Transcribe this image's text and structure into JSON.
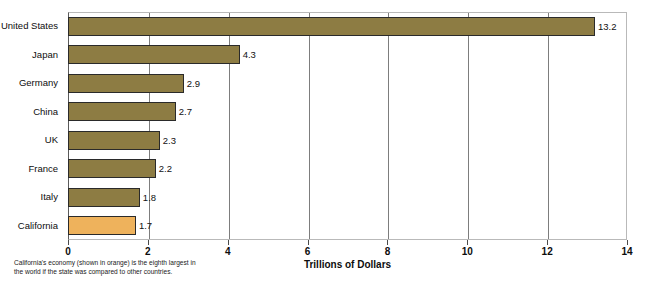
{
  "chart_data": {
    "type": "bar",
    "orientation": "horizontal",
    "title": "",
    "xlabel": "Trillions of Dollars",
    "ylabel": "",
    "xlim": [
      0,
      14
    ],
    "xticks": [
      0,
      2,
      4,
      6,
      8,
      10,
      12,
      14
    ],
    "xtick_labels": [
      "0",
      "2",
      "4",
      "6",
      "8",
      "10",
      "12",
      "14"
    ],
    "grid": true,
    "grid_axis": "x",
    "legend": null,
    "categories": [
      "United States",
      "Japan",
      "Germany",
      "China",
      "UK",
      "France",
      "Italy",
      "California"
    ],
    "values": [
      13.2,
      4.3,
      2.9,
      2.7,
      2.3,
      2.2,
      1.8,
      1.7
    ],
    "value_labels": [
      "13.2",
      "4.3",
      "2.9",
      "2.7",
      "2.3",
      "2.2",
      "1.8",
      "1.7"
    ],
    "bar_colors": [
      "brown",
      "brown",
      "brown",
      "brown",
      "brown",
      "brown",
      "brown",
      "orange"
    ],
    "annotation": "California's economy (shown in orange) is the eighth largest in the world if the state was compared to other countries."
  },
  "colors": {
    "bar_brown": "#8d7c43",
    "bar_orange": "#eeb25c",
    "bar_border": "#2a2a2a",
    "gridline": "#7d7d7d",
    "axis": "#5a5a5a",
    "text": "#0d0d0d",
    "background": "#ffffff"
  }
}
